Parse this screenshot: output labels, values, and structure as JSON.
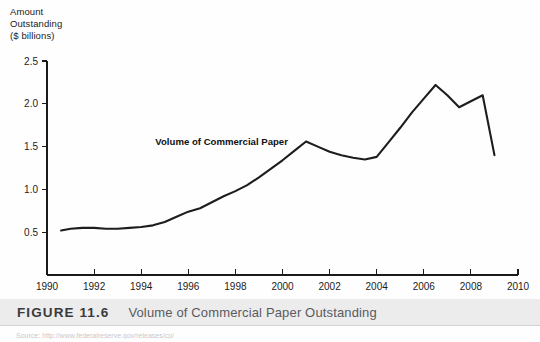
{
  "figure": {
    "caption_number": "FIGURE 11.6",
    "caption_title": "Volume of Commercial Paper Outstanding",
    "source_note": "Source: http://www.federalreserve.gov/releases/cp/"
  },
  "axis_title": {
    "line1": "Amount",
    "line2": "Outstanding",
    "line3": "($ billions)"
  },
  "chart_data": {
    "type": "line",
    "title": "Volume of Commercial Paper Outstanding",
    "xlabel": "",
    "ylabel": "Amount Outstanding ($ billions)",
    "xlim": [
      1990,
      2010
    ],
    "ylim": [
      0,
      2.5
    ],
    "grid": false,
    "legend_position": "inline-annotation",
    "annotations": [
      {
        "text": "Volume of Commercial Paper",
        "x": 1994.6,
        "y": 1.52
      }
    ],
    "xticks": [
      1990,
      1992,
      1994,
      1996,
      1998,
      2000,
      2002,
      2004,
      2006,
      2008,
      2010
    ],
    "xtick_labels": [
      "1990",
      "1992",
      "1994",
      "1996",
      "1998",
      "2000",
      "2002",
      "2004",
      "2006",
      "2008",
      "2010"
    ],
    "yticks": [
      0.5,
      1.0,
      1.5,
      2.0,
      2.5
    ],
    "ytick_labels": [
      "0.5",
      "1.0",
      "1.5",
      "2.0",
      "2.5"
    ],
    "series": [
      {
        "name": "Volume of Commercial Paper",
        "color": "#1d1d1d",
        "x": [
          1990.6,
          1991.0,
          1991.5,
          1992.0,
          1992.5,
          1993.0,
          1993.5,
          1994.0,
          1994.5,
          1995.0,
          1995.5,
          1996.0,
          1996.5,
          1997.0,
          1997.5,
          1998.0,
          1998.5,
          1999.0,
          1999.5,
          2000.0,
          2000.5,
          2001.0,
          2001.5,
          2002.0,
          2002.5,
          2003.0,
          2003.5,
          2004.0,
          2004.5,
          2005.0,
          2005.5,
          2006.0,
          2006.5,
          2007.0,
          2007.5,
          2008.0,
          2008.5,
          2009.0
        ],
        "y": [
          0.52,
          0.54,
          0.55,
          0.55,
          0.54,
          0.54,
          0.55,
          0.56,
          0.58,
          0.62,
          0.68,
          0.74,
          0.78,
          0.85,
          0.92,
          0.98,
          1.05,
          1.14,
          1.24,
          1.34,
          1.45,
          1.56,
          1.5,
          1.44,
          1.4,
          1.37,
          1.35,
          1.38,
          1.55,
          1.72,
          1.9,
          2.06,
          2.22,
          2.1,
          1.96,
          2.03,
          2.1,
          1.4
        ]
      }
    ]
  },
  "geometry": {
    "plot_left": 47,
    "plot_right": 518,
    "plot_top": 61,
    "plot_bottom": 275,
    "x_min": 1990,
    "x_max": 2010,
    "y_min": 0,
    "y_max": 2.5,
    "y_top_value": 2.5,
    "y_bottom_value": 0.0
  }
}
